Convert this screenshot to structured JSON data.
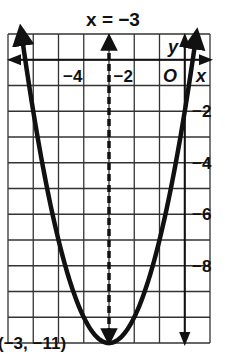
{
  "chart_data": {
    "type": "line",
    "title": "x = −3",
    "xlabel": "x",
    "ylabel": "y",
    "origin_label": "O",
    "xlim": [
      -7,
      1
    ],
    "ylim": [
      -11,
      1
    ],
    "grid": true,
    "x_ticks": [
      {
        "value": -4,
        "label": "−4"
      },
      {
        "value": -2,
        "label": "−2"
      }
    ],
    "y_ticks": [
      {
        "value": -2,
        "label": "−2"
      },
      {
        "value": -4,
        "label": "−4"
      },
      {
        "value": -6,
        "label": "−6"
      },
      {
        "value": -8,
        "label": "−8"
      }
    ],
    "series": [
      {
        "name": "parabola",
        "equation": "y = (x + 3)^2 − 11",
        "vertex": [
          -3,
          -11
        ],
        "style": "solid-bold",
        "x": [
          -6.46,
          -6,
          -5,
          -4,
          -3,
          -2,
          -1,
          0,
          0.46
        ],
        "y": [
          1,
          -2,
          -7,
          -10,
          -11,
          -10,
          -7,
          -2,
          1
        ]
      }
    ],
    "axis_of_symmetry": {
      "x": -3,
      "style": "dashed",
      "label": "x = −3"
    },
    "annotations": [
      {
        "text": "(−3, −11)",
        "x": -3,
        "y": -11
      }
    ]
  }
}
